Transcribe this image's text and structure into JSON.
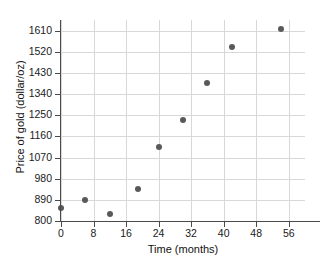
{
  "chart_data": {
    "type": "scatter",
    "title": "",
    "xlabel": "Time (months)",
    "ylabel": "Price of gold (dollar/oz)",
    "xlim": [
      0,
      60
    ],
    "ylim": [
      800,
      1655
    ],
    "xticks": [
      0,
      8,
      16,
      24,
      32,
      40,
      48,
      56
    ],
    "xtick_labels": [
      "0",
      "8",
      "16",
      "24",
      "32",
      "40",
      "48",
      "56"
    ],
    "yticks": [
      800,
      890,
      980,
      1070,
      1160,
      1250,
      1340,
      1430,
      1520,
      1610
    ],
    "ytick_labels": [
      "800",
      "890",
      "980",
      "1070",
      "1160",
      "1250",
      "1340",
      "1430",
      "1520",
      "1610"
    ],
    "grid": true,
    "legend": false,
    "marker_color": "#595959",
    "grid_color": "#d8d8d8",
    "axis_color": "#4a4a4a",
    "series": [
      {
        "name": "Price of gold",
        "points": [
          {
            "x": 0,
            "y": 855
          },
          {
            "x": 6,
            "y": 890
          },
          {
            "x": 12,
            "y": 830
          },
          {
            "x": 19,
            "y": 935
          },
          {
            "x": 24,
            "y": 1115
          },
          {
            "x": 30,
            "y": 1230
          },
          {
            "x": 36,
            "y": 1385
          },
          {
            "x": 42,
            "y": 1540
          },
          {
            "x": 54,
            "y": 1615
          }
        ]
      }
    ]
  }
}
